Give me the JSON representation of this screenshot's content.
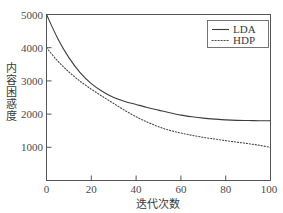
{
  "chart_data": {
    "type": "line",
    "title": "",
    "xlabel": "迭代次数",
    "ylabel": "内容困惑度",
    "xlim": [
      0,
      100
    ],
    "ylim": [
      0,
      5200
    ],
    "grid": false,
    "legend_position": "top-right",
    "xticks": [
      "0",
      "20",
      "40",
      "60",
      "80",
      "100"
    ],
    "xtick_values": [
      0,
      20,
      40,
      60,
      80,
      100
    ],
    "yticks": [
      "1000",
      "2000",
      "3000",
      "4000",
      "5000"
    ],
    "ytick_values": [
      1000,
      2000,
      3000,
      4000,
      5000
    ],
    "x": [
      0,
      5,
      10,
      15,
      20,
      25,
      30,
      35,
      40,
      45,
      50,
      55,
      60,
      65,
      70,
      75,
      80,
      85,
      90,
      95,
      100
    ],
    "series": [
      {
        "name": "LDA",
        "style": "solid",
        "color": "#3c3c3c",
        "values": [
          5000,
          4280,
          3700,
          3250,
          2920,
          2680,
          2500,
          2380,
          2290,
          2200,
          2120,
          2040,
          1970,
          1920,
          1880,
          1850,
          1825,
          1810,
          1805,
          1800,
          1800
        ]
      },
      {
        "name": "HDP",
        "style": "dotted",
        "color": "#4a4a4a",
        "values": [
          4000,
          3600,
          3270,
          2990,
          2750,
          2530,
          2320,
          2110,
          1920,
          1760,
          1620,
          1510,
          1430,
          1360,
          1300,
          1250,
          1200,
          1155,
          1110,
          1060,
          1000
        ]
      }
    ]
  },
  "legend": {
    "entries": [
      {
        "label": "LDA"
      },
      {
        "label": "HDP"
      }
    ]
  },
  "axes": {
    "x_title": "迭代次数",
    "y_title": "内容困惑度",
    "y_title_chars": [
      "内",
      "容",
      "困",
      "惑",
      "度"
    ]
  }
}
